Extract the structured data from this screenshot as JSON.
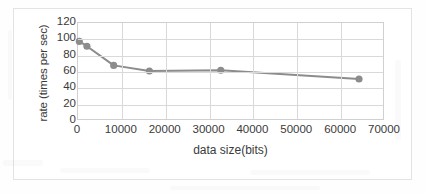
{
  "chart_data": {
    "type": "line",
    "title": "",
    "xlabel": "data size(bits)",
    "ylabel": "rate (times per sec)",
    "xlim": [
      0,
      70000
    ],
    "ylim": [
      0,
      120
    ],
    "xticks": [
      0,
      10000,
      20000,
      30000,
      40000,
      50000,
      60000,
      70000
    ],
    "xticklabels": [
      "0",
      "10000",
      "20000",
      "30000",
      "40000",
      "50000",
      "60000",
      "70000"
    ],
    "yticks": [
      0,
      20,
      40,
      60,
      80,
      100,
      120
    ],
    "yticklabels": [
      "0",
      "20",
      "40",
      "60",
      "80",
      "100",
      "120"
    ],
    "grid": "both",
    "legend": "none",
    "series": [
      {
        "name": "rate",
        "color": "#8c8c8c",
        "marker": "circle",
        "x": [
          300,
          2048,
          8192,
          16384,
          32768,
          64500
        ],
        "values": [
          97,
          91,
          67,
          60,
          61,
          50
        ]
      }
    ]
  },
  "figure": {
    "background_color": "#ffffff",
    "frame_color": "#e3e3e3",
    "axis_color": "#d0d0d0",
    "grid_color": "#d9d9d9",
    "text_color": "#3a3a3a"
  }
}
